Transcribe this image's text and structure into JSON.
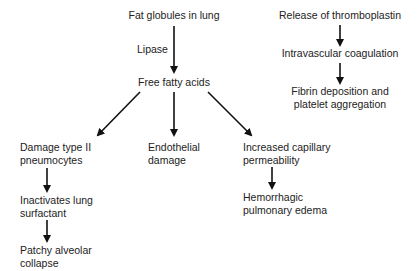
{
  "diagram": {
    "left_tree": {
      "root": "Fat globules in lung",
      "edge_label": "Lipase",
      "middle": "Free fatty acids",
      "branches": [
        {
          "node": [
            "Damage type II",
            "pneumocytes"
          ],
          "children": [
            [
              "Inactivates lung",
              "surfactant"
            ],
            [
              "Patchy alveolar",
              "collapse"
            ]
          ]
        },
        {
          "node": [
            "Endothelial",
            "damage"
          ],
          "children": []
        },
        {
          "node": [
            "Increased capillary",
            "permeability"
          ],
          "children": [
            [
              "Hemorrhagic",
              "pulmonary edema"
            ]
          ]
        }
      ]
    },
    "right_chain": {
      "steps": [
        [
          "Release of thromboplastin"
        ],
        [
          "Intravascular coagulation"
        ],
        [
          "Fibrin deposition and",
          "platelet aggregation"
        ]
      ]
    },
    "colors": {
      "text": "#222222",
      "arrow": "#111111",
      "background": "#ffffff"
    }
  }
}
